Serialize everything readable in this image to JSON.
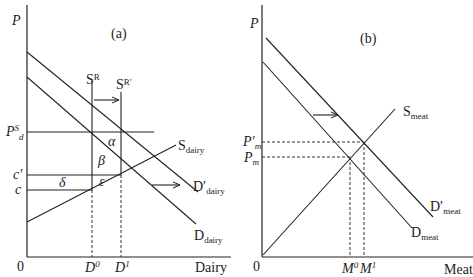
{
  "figure": {
    "panel_a": {
      "title": "(a)",
      "y_axis_label": "P",
      "x_axis_label": "Dairy",
      "origin_label": "0",
      "price_labels": {
        "psd_main": "P",
        "psd_sup": "S",
        "psd_sub": "d",
        "c_prime": "c′",
        "c": "c"
      },
      "quantity_labels": {
        "d0_main": "D",
        "d0_sup": "0",
        "d1_main": "D",
        "d1_sup": "1"
      },
      "curves": {
        "sr_main": "S",
        "sr_sup": "R",
        "srp_main": "S",
        "srp_sup": "R′",
        "s_dairy_main": "S",
        "s_dairy_sub": "dairy",
        "d_dairy_prime_main": "D′",
        "d_dairy_prime_sub": "dairy",
        "d_dairy_main": "D",
        "d_dairy_sub": "dairy"
      },
      "areas": {
        "alpha": "α",
        "beta": "β",
        "delta": "δ",
        "epsilon": "ε"
      }
    },
    "panel_b": {
      "title": "(b)",
      "y_axis_label": "P",
      "x_axis_label": "Meat",
      "origin_label": "0",
      "price_labels": {
        "pm_prime_main": "P′",
        "pm_prime_sub": "m",
        "pm_main": "P",
        "pm_sub": "m"
      },
      "quantity_labels": {
        "m0_main": "M",
        "m0_sup": "0",
        "m1_main": "M",
        "m1_sup": "1"
      },
      "curves": {
        "s_meat_main": "S",
        "s_meat_sub": "meat",
        "d_meat_prime_main": "D′",
        "d_meat_prime_sub": "meat",
        "d_meat_main": "D",
        "d_meat_sub": "meat"
      }
    }
  }
}
